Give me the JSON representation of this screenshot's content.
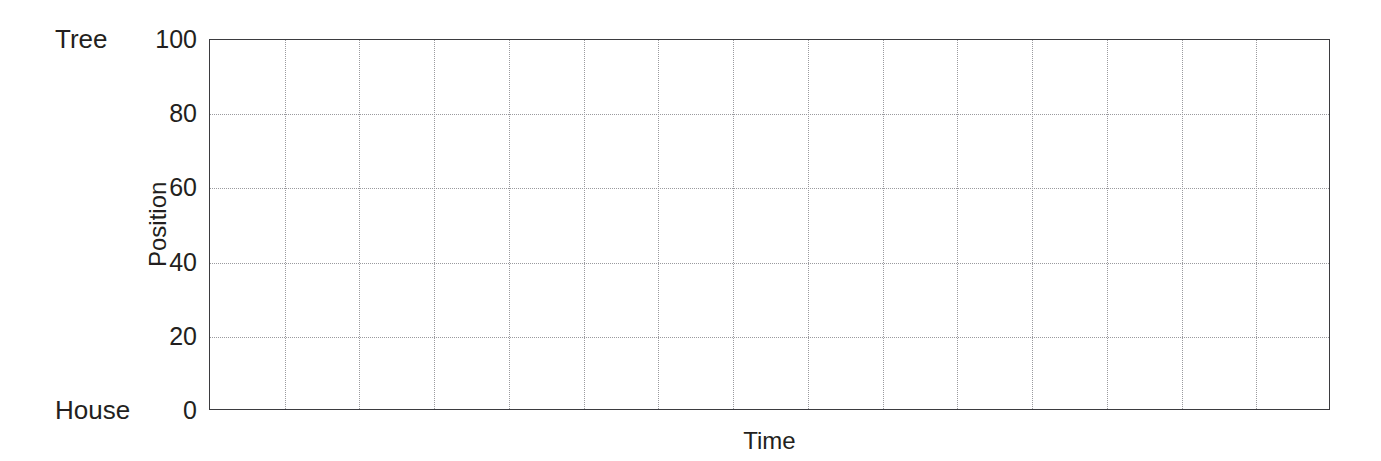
{
  "chart_data": {
    "type": "line",
    "title": "",
    "subtitle": "",
    "xlabel": "Time",
    "ylabel": "Position",
    "xlim": [
      0,
      15
    ],
    "ylim": [
      0,
      100
    ],
    "grid": true,
    "grid_style": "dotted",
    "legend": null,
    "series": [],
    "x": [],
    "y_ticks": [
      0,
      20,
      40,
      60,
      80,
      100
    ],
    "y_tick_labels": [
      "0",
      "20",
      "40",
      "60",
      "80",
      "100"
    ],
    "x_ticks": [],
    "x_tick_labels": [],
    "x_gridline_count": 14,
    "y_gridline_values": [
      20,
      40,
      60,
      80
    ],
    "axis_endpoint_labels": {
      "top": "Tree",
      "bottom": "House"
    },
    "note": "Empty / blank plot template: axes, frame and dotted grid only, no plotted data"
  },
  "axis": {
    "y_title": "Position",
    "x_title": "Time",
    "top_endpoint_label": "Tree",
    "bottom_endpoint_label": "House",
    "ticks": [
      {
        "value": 100,
        "label": "100"
      },
      {
        "value": 80,
        "label": "80"
      },
      {
        "value": 60,
        "label": "60"
      },
      {
        "value": 40,
        "label": "40"
      },
      {
        "value": 20,
        "label": "20"
      },
      {
        "value": 0,
        "label": "0"
      }
    ]
  },
  "colors": {
    "background": "#ffffff",
    "axis_line": "#3b3b3f",
    "gridline": "#9a9a9e",
    "text": "#231f20"
  }
}
